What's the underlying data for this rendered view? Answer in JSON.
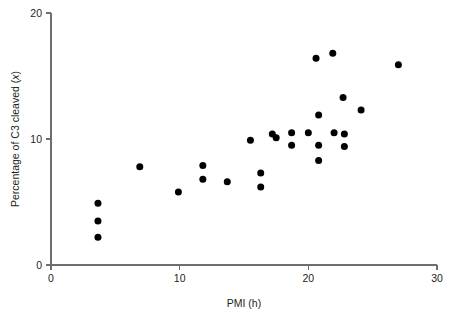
{
  "chart_data": {
    "type": "scatter",
    "title": "",
    "xlabel": "PMI (h)",
    "ylabel": "Percentage of C3 cleaved (x)",
    "ylabel_plain": "Percentage of C3 cleaved",
    "ylabel_italic_symbol": "x",
    "xlim": [
      0,
      30
    ],
    "ylim": [
      0,
      20
    ],
    "xticks": [
      0,
      10,
      20,
      30
    ],
    "yticks": [
      0,
      10,
      20
    ],
    "xtick_labels": [
      "0",
      "10",
      "20",
      "30"
    ],
    "ytick_labels": [
      "0",
      "10",
      "20"
    ],
    "grid": false,
    "legend": null,
    "marker": "filled-circle",
    "marker_color": "#000000",
    "marker_size_px": 7,
    "series": [
      {
        "name": "C3 cleavage vs PMI",
        "points": [
          [
            3.65,
            4.9
          ],
          [
            3.65,
            3.5
          ],
          [
            3.65,
            2.2
          ],
          [
            6.9,
            7.8
          ],
          [
            9.9,
            5.8
          ],
          [
            11.8,
            7.9
          ],
          [
            11.8,
            6.8
          ],
          [
            13.7,
            6.6
          ],
          [
            15.5,
            9.9
          ],
          [
            16.3,
            7.3
          ],
          [
            16.3,
            6.2
          ],
          [
            17.2,
            10.4
          ],
          [
            17.5,
            10.1
          ],
          [
            18.7,
            10.5
          ],
          [
            18.7,
            9.5
          ],
          [
            20.0,
            10.5
          ],
          [
            20.6,
            16.4
          ],
          [
            20.8,
            11.9
          ],
          [
            20.8,
            9.5
          ],
          [
            20.8,
            8.3
          ],
          [
            21.9,
            16.8
          ],
          [
            22.0,
            10.5
          ],
          [
            22.7,
            13.3
          ],
          [
            22.8,
            10.4
          ],
          [
            22.8,
            9.4
          ],
          [
            24.1,
            12.3
          ],
          [
            27.0,
            15.9
          ]
        ]
      }
    ],
    "n_points": 27
  },
  "plot_geometry": {
    "x_axis_left_px": 51,
    "x_axis_right_px": 437,
    "y_axis_bottom_px": 265,
    "y_axis_top_px": 13
  }
}
